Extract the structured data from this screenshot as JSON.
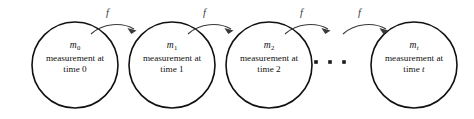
{
  "figure": {
    "type": "chain-diagram",
    "title": "",
    "background_color": "#ffffff",
    "node_stroke_color": "#111111",
    "arrow_color": "#3a3a3a",
    "text_color": "#111111"
  },
  "nodes": [
    {
      "id": "m0",
      "variable": "m",
      "subscript": "0",
      "line1": "measurement at",
      "line2": "time 0",
      "cx": 75,
      "cy": 65,
      "r": 43
    },
    {
      "id": "m1",
      "variable": "m",
      "subscript": "1",
      "line1": "measurement at",
      "line2": "time 1",
      "cx": 172,
      "cy": 65,
      "r": 43
    },
    {
      "id": "m2",
      "variable": "m",
      "subscript": "2",
      "line1": "measurement at",
      "line2": "time 2",
      "cx": 269,
      "cy": 65,
      "r": 43
    },
    {
      "id": "mt",
      "variable": "m",
      "subscript": "t",
      "line1": "measurement at",
      "line2": "time t",
      "cx": 414,
      "cy": 65,
      "r": 43
    }
  ],
  "edges": [
    {
      "id": "edge-0-1",
      "label": "f",
      "from": "m0",
      "to": "m1",
      "label_x": 106,
      "label_y": 8
    },
    {
      "id": "edge-1-2",
      "label": "f",
      "from": "m1",
      "to": "m2",
      "label_x": 203,
      "label_y": 8
    },
    {
      "id": "edge-2-3",
      "label": "f",
      "from": "m2",
      "to": "ellipsis",
      "label_x": 300,
      "label_y": 8
    },
    {
      "id": "edge-3-4",
      "label": "f",
      "from": "ellipsis",
      "to": "mt",
      "label_x": 358,
      "label_y": 8
    }
  ],
  "ellipsis": {
    "label": "continues",
    "dots": 3,
    "x_positions": [
      316,
      330,
      344
    ],
    "y": 62,
    "size": 3.6
  }
}
